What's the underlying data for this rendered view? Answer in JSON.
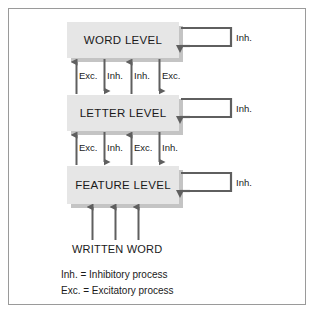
{
  "figure": {
    "title_text": "",
    "background_color": "#ffffff",
    "border_color": "#9a9a9a",
    "box_fill_color": "#e6e6e6",
    "box_shadow_color": "#c4c4c4",
    "arrow_color": "#5f5f5f",
    "text_color": "#1a1a1a"
  },
  "levels": [
    {
      "label": "WORD LEVEL"
    },
    {
      "label": "LETTER LEVEL"
    },
    {
      "label": "FEATURE LEVEL"
    }
  ],
  "self_loops": [
    {
      "label": "Inh."
    },
    {
      "label": "Inh."
    },
    {
      "label": "Inh."
    }
  ],
  "arrow_group_top": {
    "labels": [
      "Exc.",
      "Inh.",
      "Inh.",
      "Exc."
    ],
    "directions": [
      "up",
      "down",
      "up",
      "down"
    ]
  },
  "arrow_group_bottom": {
    "labels": [
      "Exc.",
      "Inh.",
      "Exc.",
      "Inh."
    ],
    "directions": [
      "up",
      "down",
      "up",
      "down"
    ]
  },
  "input": {
    "label": "WRITTEN WORD",
    "arrow_count": 3,
    "direction": "up"
  },
  "legend": [
    "Inh. = Inhibitory process",
    "Exc. = Excitatory process"
  ]
}
